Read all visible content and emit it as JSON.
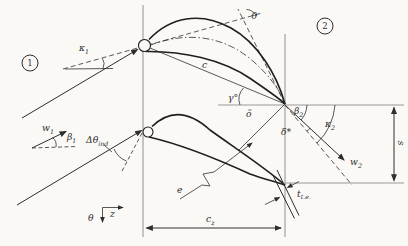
{
  "figure": {
    "colors": {
      "background": "#faf9f6",
      "ink": "#2e2e2e",
      "construction": "#9a9a96"
    },
    "stations": {
      "inlet": "1",
      "outlet": "2"
    },
    "labels": {
      "camber_angle": "θ",
      "inlet_metal_angle": {
        "base": "κ",
        "sub": "1"
      },
      "inlet_flow_angle": {
        "base": "β",
        "sub": "1"
      },
      "inlet_velocity": {
        "base": "w",
        "sub": "1"
      },
      "induced_incidence": {
        "base": "Δθ",
        "sub": "ind"
      },
      "chord": "c",
      "stagger_angle": "γ°",
      "throat": "õ",
      "suction_radius": "e",
      "exit_flow_angle": {
        "base": "β",
        "sub": "2"
      },
      "exit_metal_angle": {
        "base": "κ",
        "sub": "2"
      },
      "deviation_angle": "δ*",
      "exit_velocity": {
        "base": "w",
        "sub": "2"
      },
      "pitch": "s",
      "te_thickness": {
        "base": "t",
        "sub": "t.e."
      },
      "axial_chord": {
        "base": "c",
        "sub": "z"
      },
      "axis_tangential": "θ",
      "axis_axial": "z"
    }
  }
}
